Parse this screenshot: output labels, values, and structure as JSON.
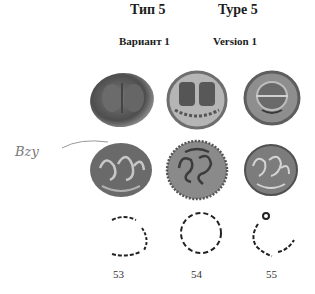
{
  "header": {
    "type_ru": "Тип 5",
    "type_en": "Type 5",
    "version_ru": "Вариант 1",
    "version_en": "Version 1"
  },
  "margin_note": "Bzy",
  "coins": [
    {
      "number": "53",
      "obverse": "two facing heads",
      "reverse": "ornamental monogram",
      "legend": "inscription drawing"
    },
    {
      "number": "54",
      "obverse": "two figures in frame",
      "reverse": "ornamental monogram",
      "legend": "inscription drawing"
    },
    {
      "number": "55",
      "obverse": "facing head",
      "reverse": "ornamental monogram",
      "legend": "inscription drawing"
    }
  ],
  "colors": {
    "coin_dark": "#5a5a5a",
    "coin_mid": "#8a8a8a",
    "coin_light": "#bdbdbd",
    "ink": "#222222"
  }
}
